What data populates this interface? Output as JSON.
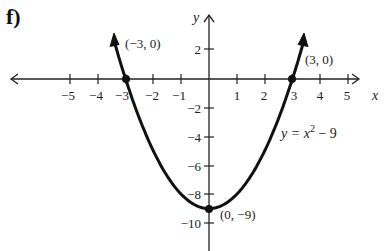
{
  "panel_label": "f)",
  "chart_data": {
    "type": "line",
    "title": "",
    "equation_label": "y = x^2 - 9",
    "xlabel": "x",
    "ylabel": "y",
    "xlim": [
      -5.5,
      5.5
    ],
    "ylim": [
      -11,
      3
    ],
    "x_ticks": [
      -5,
      -4,
      -3,
      -2,
      -1,
      1,
      2,
      3,
      4,
      5
    ],
    "y_ticks": [
      2,
      -2,
      -4,
      -6,
      -8,
      -10
    ],
    "grid": false,
    "series": [
      {
        "name": "y = x^2 - 9",
        "function": "x^2 - 9",
        "x": [
          -3.4,
          -3,
          -2,
          -1,
          0,
          1,
          2,
          3,
          3.4
        ],
        "values": [
          2.56,
          0,
          -5,
          -8,
          -9,
          -8,
          -5,
          0,
          2.56
        ]
      }
    ],
    "annotations": [
      {
        "text": "(-3, 0)",
        "x": -3,
        "y": 0
      },
      {
        "text": "(3, 0)",
        "x": 3,
        "y": 0
      },
      {
        "text": "(0, -9)",
        "x": 0,
        "y": -9
      }
    ]
  },
  "labels": {
    "x_axis": "x",
    "y_axis": "y",
    "eq_y": "y = x",
    "eq_exp": "2",
    "eq_tail": " − 9",
    "pt_left": "(−3, 0)",
    "pt_right": "(3, 0)",
    "pt_vertex": "(0, −9)",
    "xt": [
      "−5",
      "−4",
      "−3",
      "−2",
      "−1",
      "1",
      "2",
      "3",
      "4",
      "5"
    ],
    "yt": [
      "2",
      "−2",
      "−4",
      "−6",
      "−8",
      "−10"
    ]
  }
}
